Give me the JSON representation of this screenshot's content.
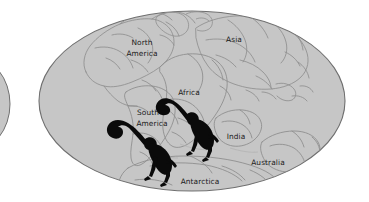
{
  "figure": {
    "kind": "paleogeographic-world-map",
    "projection": "mollweide-ellipse",
    "background_color": "#ffffff",
    "ocean_fill": "#c6c6c6",
    "outline_color": "#8c8c8c",
    "ellipse_border_color": "#6f6f6f",
    "label_color": "#1a1a1a",
    "silhouette_color": "#0a0a0a"
  },
  "labels": {
    "north_america": "North\nAmerica",
    "north_america_line1": "North",
    "north_america_line2": "America",
    "asia": "Asia",
    "africa": "Africa",
    "south_america_line1": "South",
    "south_america_line2": "America",
    "india": "India",
    "australia": "Australia",
    "antarctica": "Antarctica"
  },
  "annotations": {
    "monkey_south_america": "monkey-silhouette",
    "monkey_africa": "monkey-silhouette",
    "left_edge_fragment": "cropped-adjacent-globe"
  }
}
